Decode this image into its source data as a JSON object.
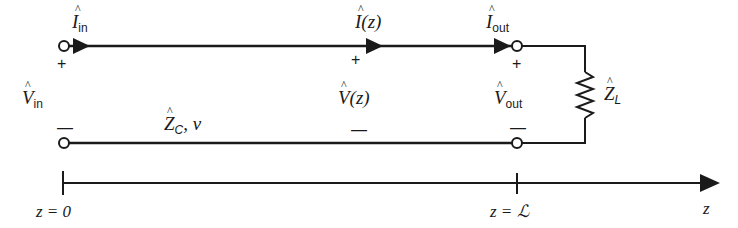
{
  "diagram": {
    "type": "transmission-line-circuit",
    "labels": {
      "I_in": {
        "sym": "I",
        "sub": "in"
      },
      "I_z": {
        "sym": "I",
        "arg": "(z)"
      },
      "I_out": {
        "sym": "I",
        "sub": "out"
      },
      "V_in": {
        "sym": "V",
        "sub": "in"
      },
      "V_z": {
        "sym": "V",
        "arg": "(z)"
      },
      "V_out": {
        "sym": "V",
        "sub": "out"
      },
      "Z_C": {
        "sym": "Z",
        "sub": "C",
        "suffix": ", v"
      },
      "Z_L": {
        "sym": "Z",
        "sub": "L"
      }
    },
    "signs": {
      "plus": "+",
      "minus": "—"
    },
    "axis": {
      "start_label": "z = 0",
      "end_label": "z = ℒ",
      "axis_name": "z"
    },
    "colors": {
      "line": "#1a1a1a",
      "background": "#ffffff"
    }
  }
}
